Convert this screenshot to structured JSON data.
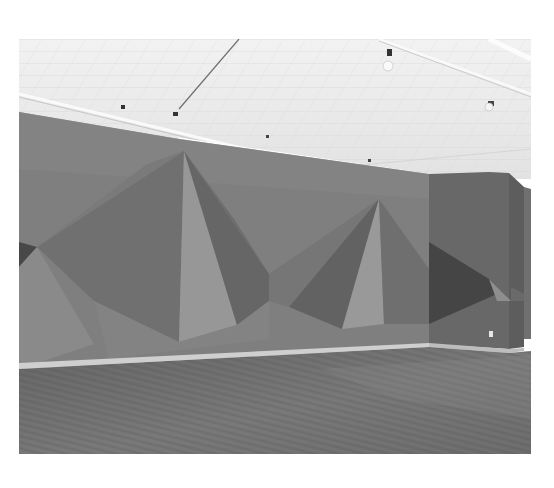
{
  "page": {
    "background": "#ffffff"
  },
  "photo": {
    "description": "Gallery interior with large geometric wall drawing of pyramidal shapes in grey tones, white coffered ceiling with track lights, and wooden plank floor",
    "frame": {
      "x": 19,
      "y": 39,
      "width": 512,
      "height": 415
    },
    "colors": {
      "ceiling": "#e9e9e9",
      "ceiling_beam": "#f7f7f7",
      "wall_base": "#7d7d7d",
      "wall_top_band": "#8a8a8a",
      "face_light": "#9a9a9a",
      "face_mid": "#858585",
      "face_dark": "#6c6c6c",
      "face_darker": "#5a5a5a",
      "face_darkest": "#474747",
      "pillar": "#666666",
      "baseboard": "#c9c9c9",
      "floor": "#6a6a6a",
      "floor_light": "#808080"
    }
  }
}
